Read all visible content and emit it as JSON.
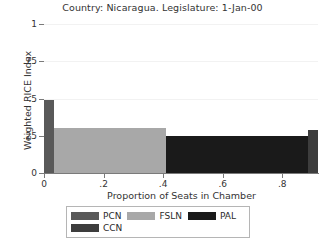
{
  "chart_data": {
    "type": "bar",
    "orientation": "stacked-width-bar",
    "title": "Country: Nicaragua. Legislature: 1-Jan-00",
    "xlabel": "Proportion of Seats in Chamber",
    "ylabel": "Weighted RICE Index",
    "xlim": [
      0,
      0.92
    ],
    "ylim": [
      0,
      1
    ],
    "grid": true,
    "legend_position": "bottom",
    "xticks": [
      {
        "value": 0,
        "label": "0"
      },
      {
        "value": 0.2,
        "label": ".2"
      },
      {
        "value": 0.4,
        "label": ".4"
      },
      {
        "value": 0.6,
        "label": ".6"
      },
      {
        "value": 0.8,
        "label": ".8"
      }
    ],
    "yticks": [
      {
        "value": 0,
        "label": "0"
      },
      {
        "value": 0.25,
        "label": ".25"
      },
      {
        "value": 0.5,
        "label": ".5"
      },
      {
        "value": 0.75,
        "label": ".75"
      },
      {
        "value": 1,
        "label": "1"
      }
    ],
    "series": [
      {
        "name": "PCN",
        "color": "#595959",
        "x_start": 0.0,
        "x_end": 0.035,
        "seat_share": 0.035,
        "value": 0.49
      },
      {
        "name": "FSLN",
        "color": "#a8a8a8",
        "x_start": 0.035,
        "x_end": 0.41,
        "seat_share": 0.375,
        "value": 0.305
      },
      {
        "name": "PAL",
        "color": "#1a1a1a",
        "x_start": 0.41,
        "x_end": 0.885,
        "seat_share": 0.475,
        "value": 0.25
      },
      {
        "name": "CCN",
        "color": "#3d3d3d",
        "x_start": 0.885,
        "x_end": 0.92,
        "seat_share": 0.035,
        "value": 0.29
      }
    ]
  },
  "legend": {
    "rows": [
      [
        {
          "label": "PCN",
          "color": "#595959"
        },
        {
          "label": "FSLN",
          "color": "#a8a8a8"
        },
        {
          "label": "PAL",
          "color": "#1a1a1a"
        }
      ],
      [
        {
          "label": "CCN",
          "color": "#3d3d3d"
        }
      ]
    ]
  }
}
